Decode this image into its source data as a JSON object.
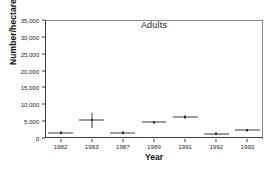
{
  "chart_data": {
    "type": "scatter",
    "title": "Adults",
    "xlabel": "Year",
    "ylabel": "Number/hectare",
    "categories": [
      "1982",
      "1983",
      "1987",
      "1989",
      "1991",
      "1992",
      "1993"
    ],
    "values": [
      1600,
      5200,
      1500,
      4700,
      6200,
      1300,
      2300
    ],
    "error_low": [
      1600,
      3100,
      1500,
      4700,
      5500,
      1300,
      2300
    ],
    "error_high": [
      1600,
      7400,
      1500,
      4700,
      6800,
      1300,
      2300
    ],
    "ylim": [
      0,
      35000
    ],
    "ytick_values": [
      0,
      5000,
      10000,
      15000,
      20000,
      25000,
      30000,
      35000
    ],
    "ytick_labels": [
      "0",
      "5,000",
      "10,000",
      "15,000",
      "20,000",
      "25,000",
      "30,000",
      "35,000"
    ],
    "grid": false,
    "legend": "none",
    "marker": "cross-with-error-bars",
    "series": [
      {
        "name": "Adults",
        "points": [
          {
            "x": "1982",
            "y": 1600,
            "low": 1600,
            "high": 1600
          },
          {
            "x": "1983",
            "y": 5200,
            "low": 3100,
            "high": 7400
          },
          {
            "x": "1987",
            "y": 1500,
            "low": 1500,
            "high": 1500
          },
          {
            "x": "1989",
            "y": 4700,
            "low": 4700,
            "high": 4700
          },
          {
            "x": "1991",
            "y": 6200,
            "low": 5500,
            "high": 6800
          },
          {
            "x": "1992",
            "y": 1300,
            "low": 1300,
            "high": 1300
          },
          {
            "x": "1993",
            "y": 2300,
            "low": 2300,
            "high": 2300
          }
        ]
      }
    ]
  },
  "colors": {
    "axis": "#3a3a3a",
    "frame": "#8a8a8a",
    "marker": "#3d3d3d",
    "text": "#262626",
    "background": "#ffffff"
  }
}
